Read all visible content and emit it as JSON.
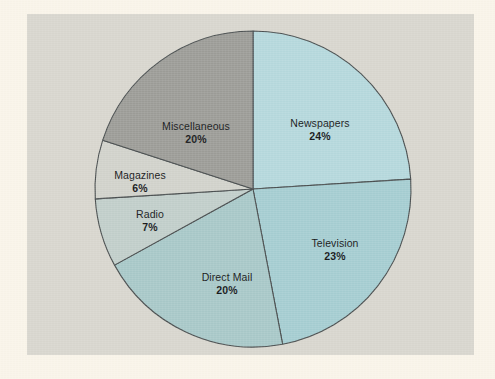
{
  "figure": {
    "background_color": "#faf5ea",
    "panel_color": "#d9d7cf",
    "outline_color": "#4a4f50"
  },
  "chart_data": {
    "type": "pie",
    "title": "",
    "subtitle": "",
    "xlabel": "",
    "ylabel": "",
    "legend_position": "none",
    "grid": false,
    "start_angle_deg": 0,
    "direction": "clockwise",
    "units": "percent",
    "total": 100,
    "categories": [
      "Newspapers",
      "Television",
      "Direct Mail",
      "Radio",
      "Magazines",
      "Miscellaneous"
    ],
    "values": [
      24,
      23,
      20,
      7,
      6,
      20
    ],
    "value_labels": [
      "24%",
      "23%",
      "20%",
      "7%",
      "6%",
      "20%"
    ],
    "colors": [
      "#b6d9dd",
      "#a6ced2",
      "#a9c9c9",
      "#c2cfcb",
      "#d2d3cc",
      "#9d9d98"
    ],
    "slices": [
      {
        "name": "Newspapers",
        "value": 24,
        "value_label": "24%",
        "color": "#b6d9dd",
        "label_x": 320,
        "label_y": 130
      },
      {
        "name": "Television",
        "value": 23,
        "value_label": "23%",
        "color": "#a6ced2",
        "label_x": 335,
        "label_y": 250
      },
      {
        "name": "Direct Mail",
        "value": 20,
        "value_label": "20%",
        "color": "#a9c9c9",
        "label_x": 227,
        "label_y": 284
      },
      {
        "name": "Radio",
        "value": 7,
        "value_label": "7%",
        "color": "#c2cfcb",
        "label_x": 150,
        "label_y": 221
      },
      {
        "name": "Magazines",
        "value": 6,
        "value_label": "6%",
        "color": "#d2d3cc",
        "label_x": 140,
        "label_y": 182
      },
      {
        "name": "Miscellaneous",
        "value": 20,
        "value_label": "20%",
        "color": "#9d9d98",
        "label_x": 196,
        "label_y": 133
      }
    ],
    "geometry": {
      "center_x": 253,
      "center_y": 189,
      "radius": 158
    }
  }
}
